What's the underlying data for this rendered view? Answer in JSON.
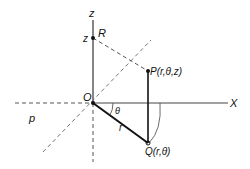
{
  "labels": {
    "z_axis": "z",
    "z_value": "z",
    "R": "R",
    "P": "P(r,θ,z)",
    "O": "O",
    "X": "X",
    "theta": "θ",
    "r": "r",
    "Q": "Q(r,θ)",
    "p": "p"
  },
  "colors": {
    "line": "#222222",
    "dashed": "#555555"
  }
}
